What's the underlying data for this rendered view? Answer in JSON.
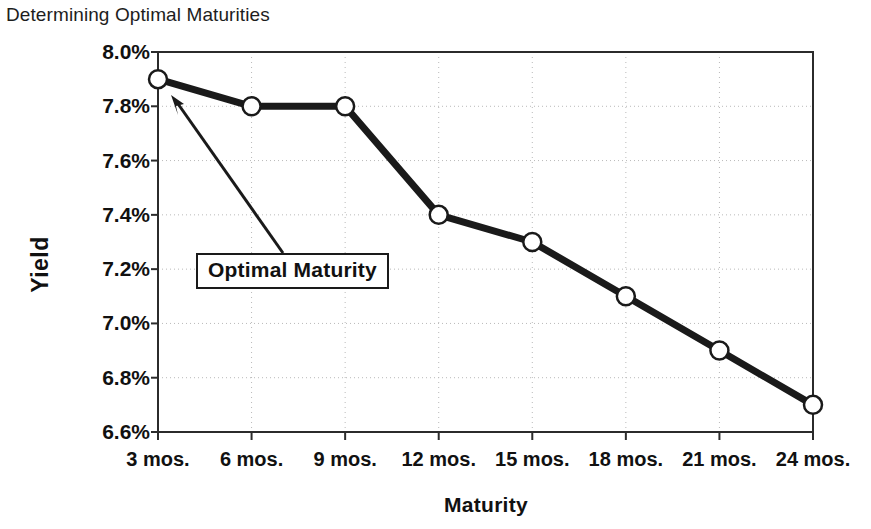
{
  "chart_data": {
    "type": "line",
    "title": "Determining Optimal Maturities",
    "xlabel": "Maturity",
    "ylabel": "Yield",
    "categories": [
      "3 mos.",
      "6 mos.",
      "9 mos.",
      "12 mos.",
      "15 mos.",
      "18 mos.",
      "21 mos.",
      "24 mos."
    ],
    "values": [
      7.9,
      7.8,
      7.8,
      7.4,
      7.3,
      7.1,
      6.9,
      6.7
    ],
    "value_labels": [
      "7.9%",
      "7.8%",
      "7.8%",
      "7.4%",
      "7.3%",
      "7.1%",
      "6.9%",
      "6.7%"
    ],
    "ylim": [
      6.6,
      8.0
    ],
    "ytick_labels": [
      "8.0%",
      "7.8%",
      "7.6%",
      "7.4%",
      "7.2%",
      "7.0%",
      "6.8%",
      "6.6%"
    ],
    "ytick_values": [
      8.0,
      7.8,
      7.6,
      7.4,
      7.2,
      7.0,
      6.8,
      6.6
    ],
    "grid": true,
    "legend": "none",
    "series": [
      {
        "name": "Yield",
        "values": [
          7.9,
          7.8,
          7.8,
          7.4,
          7.3,
          7.1,
          6.9,
          6.7
        ],
        "line_color": "#1a1a1a",
        "marker": "circle-open",
        "marker_fill": "#ffffff"
      }
    ],
    "annotations": [
      {
        "text": "Optimal Maturity",
        "points_to_category": "3 mos.",
        "points_to_value": 7.9
      }
    ]
  },
  "colors": {
    "line": "#1a1a1a",
    "axis": "#2b2b2b",
    "grid": "#b9b9b9",
    "marker_fill": "#ffffff",
    "text": "#111111",
    "background": "#ffffff"
  }
}
